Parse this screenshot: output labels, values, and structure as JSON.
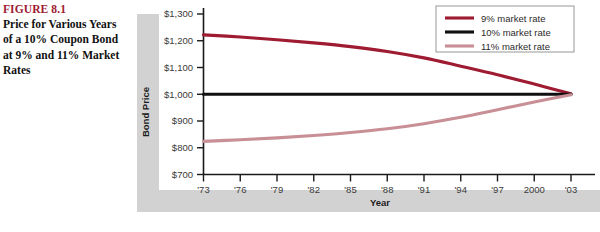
{
  "figure": {
    "number": "FIGURE 8.1",
    "caption": "Price for Various Years of a 10% Coupon Bond at 9% and 11% Market Rates",
    "number_color": "#9e1b32"
  },
  "chart_data": {
    "type": "line",
    "title": "",
    "xlabel": "Year",
    "ylabel": "Bond Price",
    "ylim": [
      700,
      1300
    ],
    "ytick_labels": [
      "$1,300",
      "$1,200",
      "$1,100",
      "$1,000",
      "$900",
      "$800",
      "$700"
    ],
    "ytick_values": [
      1300,
      1200,
      1100,
      1000,
      900,
      800,
      700
    ],
    "xlim": [
      1973,
      2003
    ],
    "x": [
      1973,
      1976,
      1979,
      1982,
      1985,
      1988,
      1991,
      1994,
      1997,
      2000,
      2003
    ],
    "xtick_labels": [
      "'73",
      "'76",
      "'79",
      "'82",
      "'85",
      "'88",
      "'91",
      "'94",
      "'97",
      "2000",
      "'03"
    ],
    "grid": false,
    "legend_position": "top-right",
    "series": [
      {
        "name": "9% market rate",
        "color": "#9e1b32",
        "width": 3.1,
        "values": [
          1222,
          1214,
          1204,
          1192,
          1178,
          1160,
          1136,
          1105,
          1073,
          1038,
          1002
        ]
      },
      {
        "name": "10% market rate",
        "color": "#101010",
        "width": 3.1,
        "values": [
          1000,
          1000,
          1000,
          1000,
          1000,
          1000,
          1000,
          1000,
          1000,
          1000,
          1000
        ]
      },
      {
        "name": "11% market rate",
        "color": "#c98f96",
        "width": 3.1,
        "values": [
          824,
          830,
          837,
          846,
          857,
          871,
          890,
          914,
          942,
          971,
          998
        ]
      }
    ]
  },
  "panel": {
    "band_color": "#d2d2d2",
    "plot_bg": "#ffffff",
    "axis_color": "#1a1a1a",
    "legend_border": "#8d8d8d"
  }
}
